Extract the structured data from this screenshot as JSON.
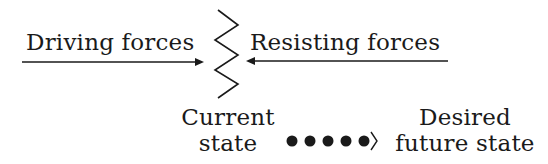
{
  "diagram": {
    "type": "force-field-analysis",
    "driving_forces": {
      "label": "Driving forces",
      "arrow_direction": "right"
    },
    "resisting_forces": {
      "label": "Resisting forces",
      "arrow_direction": "left"
    },
    "barrier": {
      "shape": "zigzag"
    },
    "current_state": {
      "line1": "Current",
      "line2": "state"
    },
    "transition": {
      "dot_count": 5,
      "terminator": "⟩"
    },
    "desired_state": {
      "line1": "Desired",
      "line2": "future state"
    },
    "colors": {
      "ink": "#1a1a1a",
      "background": "#ffffff"
    }
  }
}
